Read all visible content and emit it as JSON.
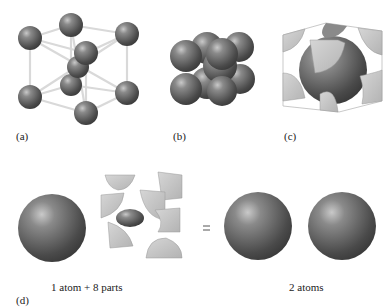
{
  "panels": {
    "a": {
      "label": "(a)",
      "description": "body-centered cubic lattice, ball-and-stick"
    },
    "b": {
      "label": "(b)",
      "description": "body-centered cubic, space-filling spheres"
    },
    "c": {
      "label": "(c)",
      "description": "unit cell cut showing central atom and corner fragments"
    },
    "d": {
      "label": "(d)",
      "equals": "=",
      "left_caption": "1 atom + 8 parts",
      "right_caption": "2 atoms"
    }
  },
  "colors": {
    "atom": "#555555",
    "atom_highlight": "#9a9a9a",
    "cube_face": "#c8c8c8",
    "bond": "#dddddd"
  }
}
